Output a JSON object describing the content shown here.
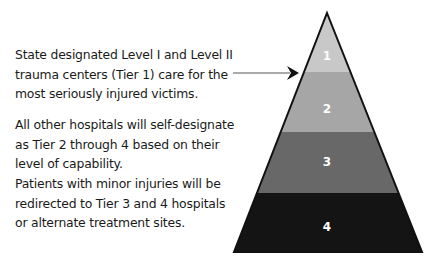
{
  "descriptions": [
    {
      "text": "State designated Level I and Level II trauma centers (Tier 1) care for the most seriously injured victims."
    },
    {
      "text": "All other hospitals will self-designate as Tier 2 through 4 based on their level of capability."
    },
    {
      "text": "Patients with minor injuries will be redirected to Tier 3 and 4 hospitals or alternate treatment sites."
    }
  ],
  "pyramid": {
    "tiers": [
      {
        "label": "1",
        "color": "#c8c8c8"
      },
      {
        "label": "2",
        "color": "#a6a6a6"
      },
      {
        "label": "3",
        "color": "#686868"
      },
      {
        "label": "4",
        "color": "#141414"
      }
    ],
    "outline_color": "#111111",
    "arrow_color": "#222222"
  }
}
